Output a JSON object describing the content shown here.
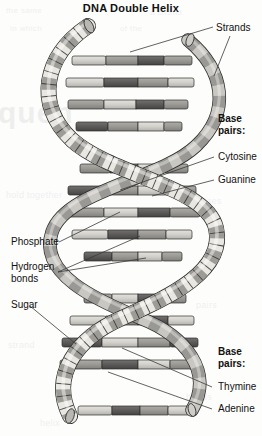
{
  "document": {
    "title": "DNA Double Helix",
    "figure_type": "scientific-illustration",
    "subject": "DNA double helix structure diagram"
  },
  "colors": {
    "page_background": "#fdfdfc",
    "ink": "#111111",
    "outline": "#2b2b2b",
    "backbone_light": "#eceae5",
    "backbone_mid": "#a9a7a2",
    "backbone_dark": "#6e6c68",
    "rung_light": "#d9d7d2",
    "rung_mid": "#9d9b96",
    "rung_dark": "#5e5c58",
    "leader_line": "#3a3a3a"
  },
  "labels": {
    "strands": "Strands",
    "base_pairs_top": "Base\npairs:",
    "cytosine": "Cytosine",
    "guanine": "Guanine",
    "phosphate": "Phosphate",
    "hydrogen_bonds": "Hydrogen\nbonds",
    "sugar": "Sugar",
    "base_pairs_bottom": "Base\npairs:",
    "thymine": "Thymine",
    "adenine": "Adenine"
  },
  "bleed_text": {
    "b1": "quen",
    "b2": "the same",
    "b3": "a strand",
    "b4": "in which",
    "b5": "of the",
    "b6": "hold together",
    "b7": "the bases",
    "b8": "strand",
    "b9": "pairs",
    "b10": "helix",
    "b11": "bonds"
  },
  "figure_parts": [
    {
      "name": "strands",
      "description": "two sugar-phosphate backbone ribbons winding around each other"
    },
    {
      "name": "base-pairs",
      "description": "horizontal rungs connecting the two strands"
    },
    {
      "name": "phosphate",
      "description": "dark segments of the backbone ribbon"
    },
    {
      "name": "sugar",
      "description": "light segments of the backbone ribbon"
    },
    {
      "name": "hydrogen-bonds",
      "description": "junction in the middle of each base-pair rung"
    },
    {
      "name": "cytosine",
      "description": "one base of a C-G pair"
    },
    {
      "name": "guanine",
      "description": "one base of a C-G pair"
    },
    {
      "name": "thymine",
      "description": "one base of a T-A pair"
    },
    {
      "name": "adenine",
      "description": "one base of a T-A pair"
    }
  ]
}
